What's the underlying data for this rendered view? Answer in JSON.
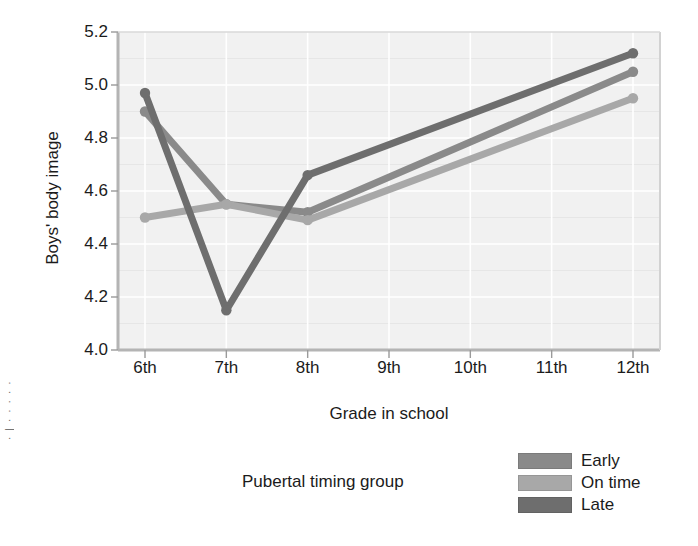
{
  "axis": {
    "y_title": "Boys' body image",
    "x_title": "Grade in school"
  },
  "legend": {
    "title": "Pubertal timing group",
    "entries": [
      {
        "label": "Early",
        "color": "#8a8a8a"
      },
      {
        "label": "On time",
        "color": "#a8a8a8"
      },
      {
        "label": "Late",
        "color": "#6e6e6e"
      }
    ]
  },
  "margin_artifact": "·|·····",
  "chart_data": {
    "type": "line",
    "title": "",
    "xlabel": "Grade in school",
    "ylabel": "Boys' body image",
    "categories": [
      "6th",
      "7th",
      "8th",
      "9th",
      "10th",
      "11th",
      "12th"
    ],
    "ytick_labels": [
      "5.2",
      "5.0",
      "4.8",
      "4.6",
      "4.4",
      "4.2",
      "4.0"
    ],
    "yticks": [
      5.2,
      5.0,
      4.8,
      4.6,
      4.4,
      4.2,
      4.0
    ],
    "ylim": [
      4.0,
      5.2
    ],
    "xlim_categories": [
      "6th",
      "12th"
    ],
    "grid": true,
    "legend_position": "bottom-right",
    "markers": "round",
    "series": [
      {
        "name": "Early",
        "color": "#8a8a8a",
        "x": [
          "6th",
          "7th",
          "8th",
          "12th"
        ],
        "values": [
          4.9,
          4.55,
          4.52,
          5.05
        ]
      },
      {
        "name": "On time",
        "color": "#a8a8a8",
        "x": [
          "6th",
          "7th",
          "8th",
          "12th"
        ],
        "values": [
          4.5,
          4.55,
          4.49,
          4.95
        ]
      },
      {
        "name": "Late",
        "color": "#6e6e6e",
        "x": [
          "6th",
          "7th",
          "8th",
          "12th"
        ],
        "values": [
          4.97,
          4.15,
          4.66,
          5.12
        ]
      }
    ]
  }
}
